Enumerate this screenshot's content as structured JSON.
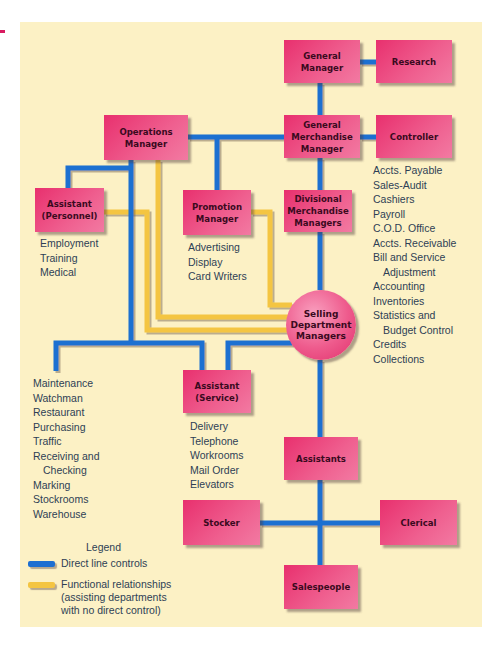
{
  "colors": {
    "background": "#fcf1c5",
    "box_fill": "#e8306e",
    "direct_line": "#1d6fd1",
    "functional_line": "#f4c542",
    "text": "#2e3f55"
  },
  "nodes": {
    "general_manager": [
      "General",
      "Manager"
    ],
    "research": [
      "Research"
    ],
    "general_merchandise_manager": [
      "General",
      "Merchandise",
      "Manager"
    ],
    "controller": [
      "Controller"
    ],
    "operations_manager": [
      "Operations",
      "Manager"
    ],
    "assistant_personnel": [
      "Assistant",
      "(Personnel)"
    ],
    "promotion_manager": [
      "Promotion",
      "Manager"
    ],
    "divisional_merchandise_managers": [
      "Divisional",
      "Merchandise",
      "Managers"
    ],
    "selling_department_managers": [
      "Selling",
      "Department",
      "Managers"
    ],
    "assistant_service": [
      "Assistant",
      "(Service)"
    ],
    "assistants": [
      "Assistants"
    ],
    "stocker": [
      "Stocker"
    ],
    "clerical": [
      "Clerical"
    ],
    "salespeople": [
      "Salespeople"
    ]
  },
  "lists": {
    "controller_functions": [
      "Accts. Payable",
      "Sales-Audit",
      "Cashiers",
      "Payroll",
      "C.O.D. Office",
      "Accts. Receivable",
      "Bill and Service",
      "Adjustment",
      "Accounting",
      "Inventories",
      "Statistics and",
      "Budget Control",
      "Credits",
      "Collections"
    ],
    "personnel_functions": [
      "Employment",
      "Training",
      "Medical"
    ],
    "promotion_functions": [
      "Advertising",
      "Display",
      "Card Writers"
    ],
    "operations_functions": [
      "Maintenance",
      "Watchman",
      "Restaurant",
      "Purchasing",
      "Traffic",
      "Receiving and",
      "Checking",
      "Marking",
      "Stockrooms",
      "Warehouse"
    ],
    "service_functions": [
      "Delivery",
      "Telephone",
      "Workrooms",
      "Mail Order",
      "Elevators"
    ]
  },
  "legend": {
    "title": "Legend",
    "items": [
      {
        "label": "Direct line controls",
        "color": "#1d6fd1"
      },
      {
        "label_lines": [
          "Functional relationships",
          "(assisting departments",
          "with no direct control)"
        ],
        "color": "#f4c542"
      }
    ]
  }
}
